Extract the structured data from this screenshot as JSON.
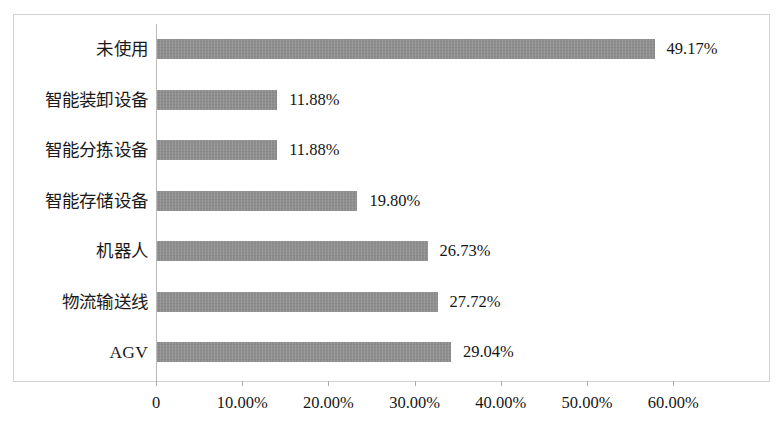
{
  "chart_data": {
    "type": "bar",
    "orientation": "horizontal",
    "title": "",
    "subtitle": "",
    "xlabel": "",
    "ylabel": "",
    "grid": false,
    "legend": null,
    "xlim": [
      0,
      60
    ],
    "xticks": [
      "0",
      "10.00%",
      "20.00%",
      "30.00%",
      "40.00%",
      "50.00%",
      "60.00%"
    ],
    "xtick_values": [
      0,
      10,
      20,
      30,
      40,
      50,
      60
    ],
    "categories": [
      "未使用",
      "智能装卸设备",
      "智能分拣设备",
      "智能存储设备",
      "机器人",
      "物流输送线",
      "AGV"
    ],
    "values": [
      49.17,
      11.88,
      11.88,
      19.8,
      26.73,
      27.72,
      29.04
    ],
    "data_labels": [
      "49.17%",
      "11.88%",
      "11.88%",
      "19.80%",
      "26.73%",
      "27.72%",
      "29.04%"
    ],
    "series": [
      {
        "name": "",
        "values": [
          49.17,
          11.88,
          11.88,
          19.8,
          26.73,
          27.72,
          29.04
        ]
      }
    ],
    "colors": {
      "bar_fill": "#8e8e8e",
      "axis_line": "#b9b9b9",
      "frame": "#d2d2d2",
      "background": "#ffffff",
      "text": "#151515"
    }
  }
}
